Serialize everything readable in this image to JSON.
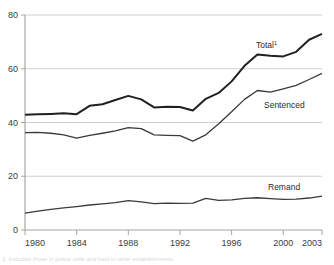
{
  "chart_data": {
    "type": "line",
    "title": "",
    "subtitle": "",
    "xlabel": "",
    "ylabel": "",
    "xlim": [
      1980,
      2003
    ],
    "ylim": [
      0,
      80
    ],
    "grid": true,
    "gridlines_y": [
      0,
      20,
      40,
      60,
      80
    ],
    "legend_position": "inline-right",
    "y_ticks": [
      "0",
      "20",
      "40",
      "60",
      "80"
    ],
    "y_tick_values": [
      0,
      20,
      40,
      60,
      80
    ],
    "x_ticks": [
      "1980",
      "1984",
      "1988",
      "1992",
      "1996",
      "2000",
      "2003"
    ],
    "x_tick_values": [
      1980,
      1984,
      1988,
      1992,
      1996,
      2000,
      2003
    ],
    "x": [
      1980,
      1981,
      1982,
      1983,
      1984,
      1985,
      1986,
      1987,
      1988,
      1989,
      1990,
      1991,
      1992,
      1993,
      1994,
      1995,
      1996,
      1997,
      1998,
      1999,
      2000,
      2001,
      2002,
      2003
    ],
    "series": [
      {
        "name": "Total",
        "label": "Total",
        "superscript": "1",
        "color": "#231f20",
        "values": [
          42.9,
          43.1,
          43.2,
          43.4,
          43.1,
          46.2,
          46.8,
          48.4,
          49.9,
          48.6,
          45.6,
          45.9,
          45.8,
          44.5,
          48.8,
          51.0,
          55.3,
          61.1,
          65.3,
          64.8,
          64.6,
          66.3,
          70.8,
          73.0
        ],
        "endpoint_value": 73.0
      },
      {
        "name": "Sentenced",
        "label": "Sentenced",
        "color": "#3a3a3a",
        "values": [
          36.2,
          36.3,
          36.0,
          35.4,
          34.2,
          35.2,
          36.0,
          36.9,
          38.1,
          37.7,
          35.4,
          35.2,
          35.1,
          33.1,
          35.4,
          39.5,
          44.0,
          48.6,
          51.9,
          51.3,
          52.5,
          53.8,
          56.0,
          58.3
        ],
        "endpoint_value": 58.3
      },
      {
        "name": "Remand",
        "label": "Remand",
        "color": "#3a3a3a",
        "values": [
          6.3,
          7.0,
          7.7,
          8.2,
          8.7,
          9.3,
          9.7,
          10.2,
          10.9,
          10.5,
          9.8,
          10.0,
          9.9,
          10.0,
          11.8,
          11.0,
          11.2,
          11.8,
          12.0,
          11.7,
          11.4,
          11.5,
          11.9,
          12.6
        ],
        "endpoint_value": 12.6
      }
    ]
  },
  "axis": {
    "y_labels": [
      "80",
      "60",
      "40",
      "20",
      "0"
    ],
    "x_labels": [
      "1980",
      "1984",
      "1988",
      "1992",
      "1996",
      "2000",
      "2003"
    ]
  },
  "labels": {
    "total": "Total",
    "total_superscript": "1",
    "sentenced": "Sentenced",
    "remand": "Remand"
  },
  "footnote": {
    "text": "1. Includes those in police cells and held in other establishments."
  },
  "colors": {
    "line_total": "#231f20",
    "line_sentenced": "#3a3a3a",
    "line_remand": "#3a3a3a",
    "grid": "#cfcfcf",
    "axis": "#a6a6a6",
    "tick_text": "#3b3b3b"
  }
}
